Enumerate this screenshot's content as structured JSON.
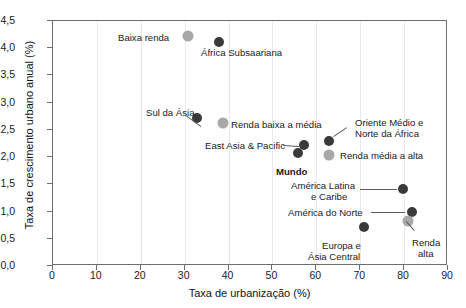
{
  "chart_data": {
    "type": "scatter",
    "title": "",
    "xlabel": "Taxa de urbanização (%)",
    "ylabel": "Taxa de crescimento urbano anual (%)",
    "xlim": [
      0,
      90
    ],
    "ylim": [
      0.0,
      4.5
    ],
    "xticks": [
      "0",
      "10",
      "20",
      "30",
      "40",
      "50",
      "60",
      "70",
      "80",
      "90"
    ],
    "xtick_values": [
      0,
      10,
      20,
      30,
      40,
      50,
      60,
      70,
      80,
      90
    ],
    "yticks": [
      "0,0",
      "0,5",
      "1,0",
      "1,5",
      "2,0",
      "2,5",
      "3,0",
      "3,5",
      "4,0",
      "4,5"
    ],
    "ytick_values": [
      0.0,
      0.5,
      1.0,
      1.5,
      2.0,
      2.5,
      3.0,
      3.5,
      4.0,
      4.5
    ],
    "grid": true,
    "legend": "none",
    "colors": {
      "marker_dark": "#3a3a3a",
      "marker_light": "#a8a8a8",
      "axis": "#6e6e6e",
      "grid": "#eceaea",
      "text": "#1a1a1a"
    },
    "points": [
      {
        "label": "Baixa renda",
        "x": 31.0,
        "y": 4.2,
        "shade": "light"
      },
      {
        "label": "África Subsaariana",
        "x": 38.0,
        "y": 4.1,
        "shade": "dark"
      },
      {
        "label": "Sul da Ásia",
        "x": 33.0,
        "y": 2.7,
        "shade": "dark"
      },
      {
        "label": "Renda baixa a média",
        "x": 39.0,
        "y": 2.6,
        "shade": "light"
      },
      {
        "label": "Oriente Médio e Norte da África",
        "x": 63.0,
        "y": 2.28,
        "shade": "dark"
      },
      {
        "label": "East Asia & Pacific",
        "x": 57.5,
        "y": 2.2,
        "shade": "dark"
      },
      {
        "label": "Mundo",
        "x": 56.0,
        "y": 2.05,
        "shade": "dark"
      },
      {
        "label": "Renda média a alta",
        "x": 63.0,
        "y": 2.02,
        "shade": "light"
      },
      {
        "label": "América Latina e Caribe",
        "x": 80.0,
        "y": 1.4,
        "shade": "dark"
      },
      {
        "label": "América do Norte",
        "x": 82.0,
        "y": 0.98,
        "shade": "dark"
      },
      {
        "label": "Renda alta",
        "x": 81.0,
        "y": 0.8,
        "shade": "light"
      },
      {
        "label": "Europa e Ásia Central",
        "x": 71.0,
        "y": 0.7,
        "shade": "dark"
      }
    ]
  },
  "annotations": {
    "baixa_renda": "Baixa renda",
    "africa_subsaariana": "África Subsaariana",
    "sul_da_asia": "Sul da Ásia",
    "renda_baixa_media": "Renda baixa a média",
    "east_asia_pacific": "East Asia & Pacific",
    "mundo": "Mundo",
    "oriente_medio_l1": "Oriente Médio e",
    "oriente_medio_l2": "Norte da África",
    "renda_media_alta": "Renda média a alta",
    "america_latina_l1": "América Latina",
    "america_latina_l2": "e Caribe",
    "america_do_norte": "América do Norte",
    "renda_alta_l1": "Renda",
    "renda_alta_l2": "alta",
    "europa_asia_l1": "Europa e",
    "europa_asia_l2": "Ásia Central"
  },
  "axes": {
    "x_title": "Taxa de urbanização (%)",
    "y_title": "Taxa de crescimento urbano anual (%)",
    "x_labels": [
      "0",
      "10",
      "20",
      "30",
      "40",
      "50",
      "60",
      "70",
      "80",
      "90"
    ],
    "y_labels": [
      "0,0",
      "0,5",
      "1,0",
      "1,5",
      "2,0",
      "2,5",
      "3,0",
      "3,5",
      "4,0",
      "4,5"
    ]
  }
}
